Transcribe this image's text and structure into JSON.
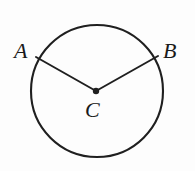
{
  "figure": {
    "background_color": "#fdfdfd",
    "stroke_color": "#1f1f1f",
    "width": 195,
    "height": 171
  },
  "labels": {
    "a": "A",
    "b": "B",
    "c": "C"
  },
  "geometry": {
    "circle": {
      "center_x": 97,
      "center_y": 91,
      "radius": 66,
      "stroke_width": 2.1,
      "fill": "none"
    },
    "center_point": {
      "cx": 96,
      "cy": 91,
      "r": 3.2,
      "fill": "#1f1f1f"
    },
    "radius_to_a": {
      "x1": 96,
      "y1": 91,
      "x2": 36,
      "y2": 57,
      "stroke_width": 2.0
    },
    "radius_to_b": {
      "x1": 96,
      "y1": 91,
      "x2": 158,
      "y2": 56,
      "stroke_width": 2.0
    }
  }
}
